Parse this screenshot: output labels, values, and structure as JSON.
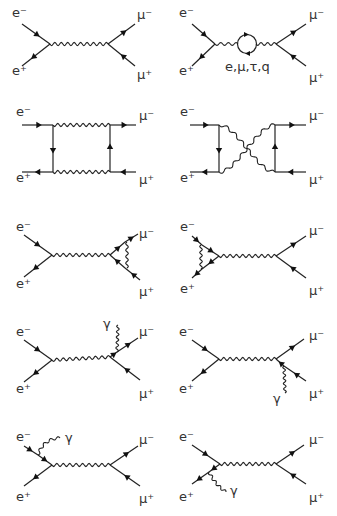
{
  "labels": {
    "e_minus": "e⁻",
    "e_plus": "e⁺",
    "mu_minus": "μ⁻",
    "mu_plus": "μ⁺",
    "gamma": "γ",
    "loop_particles": "e,μ,τ,q"
  },
  "diagrams": [
    {
      "id": 1,
      "kind": "tree-level s-channel photon exchange"
    },
    {
      "id": 2,
      "kind": "vacuum polarization loop",
      "loop_label": "e,μ,τ,q"
    },
    {
      "id": 3,
      "kind": "box diagram (direct)"
    },
    {
      "id": 4,
      "kind": "box diagram (crossed)"
    },
    {
      "id": 5,
      "kind": "vertex correction (final state)"
    },
    {
      "id": 6,
      "kind": "vertex correction (initial state)"
    },
    {
      "id": 7,
      "kind": "final-state radiation from mu-",
      "photon_label": "γ"
    },
    {
      "id": 8,
      "kind": "final-state radiation from mu+",
      "photon_label": "γ"
    },
    {
      "id": 9,
      "kind": "initial-state radiation from e-",
      "photon_label": "γ"
    },
    {
      "id": 10,
      "kind": "initial-state radiation from e+",
      "photon_label": "γ"
    }
  ]
}
